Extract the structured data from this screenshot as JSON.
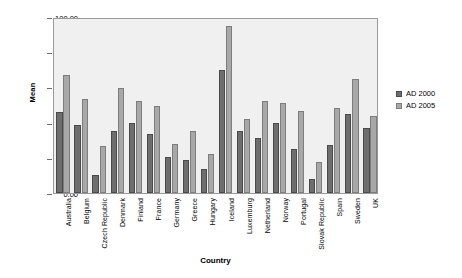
{
  "chart_data": {
    "type": "bar",
    "title": "",
    "xlabel": "Country",
    "ylabel": "Mean",
    "ylim": [
      0,
      100
    ],
    "yticks": [
      "0.00",
      "20.00",
      "40.00",
      "60.00",
      "80.00",
      "100.00"
    ],
    "ytick_values": [
      0,
      20,
      40,
      60,
      80,
      100
    ],
    "grid": false,
    "legend_position": "right",
    "categories": [
      "Australia",
      "Belgium",
      "Czech Republic",
      "Denmark",
      "Finland",
      "France",
      "Germany",
      "Greece",
      "Hungary",
      "Iceland",
      "Luxemburg",
      "Netherland",
      "Norway",
      "Portugal",
      "Slovak Republic",
      "Spain",
      "Sweden",
      "UK"
    ],
    "series": [
      {
        "name": "AD 2000",
        "color": "#6e6e6e",
        "values": [
          46,
          38.5,
          10,
          35,
          39.5,
          33.5,
          20.5,
          19,
          13.5,
          70,
          35.5,
          31,
          40,
          25,
          8,
          27,
          45,
          37
        ]
      },
      {
        "name": "AD 2005",
        "color": "#a8a8a8",
        "values": [
          67,
          53.5,
          26.5,
          59.5,
          52,
          49.5,
          28,
          35.5,
          22,
          95,
          42,
          52.5,
          51,
          46.5,
          17.5,
          48.5,
          65,
          44
        ]
      }
    ]
  },
  "legend": {
    "items": [
      {
        "label": "AD 2000"
      },
      {
        "label": "AD 2005"
      }
    ]
  }
}
